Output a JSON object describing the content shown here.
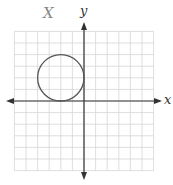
{
  "figure": {
    "annotation": "X",
    "x_axis_label": "x",
    "y_axis_label": "y",
    "grid": {
      "cells_x": 12,
      "cells_y": 12,
      "color": "#d0d0d0"
    },
    "circle": {
      "center": [
        -2,
        2
      ],
      "radius": 2,
      "color": "#555555"
    }
  }
}
